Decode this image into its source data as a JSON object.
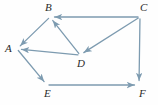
{
  "figure": {
    "kind": "directed-graph-diagram",
    "background_color": "#fefefe",
    "edge_color": "#7d9bb0",
    "label_color": "#2b2b2b"
  },
  "vertices": [
    {
      "id": "A",
      "label": "A",
      "x": 17,
      "y": 49,
      "label_x": 5,
      "label_y": 43
    },
    {
      "id": "B",
      "label": "B",
      "x": 50,
      "y": 17,
      "label_x": 45,
      "label_y": 2
    },
    {
      "id": "C",
      "label": "C",
      "x": 140,
      "y": 17,
      "label_x": 140,
      "label_y": 2
    },
    {
      "id": "D",
      "label": "D",
      "x": 80,
      "y": 55,
      "label_x": 77,
      "label_y": 58
    },
    {
      "id": "E",
      "label": "E",
      "x": 47,
      "y": 85,
      "label_x": 44,
      "label_y": 88
    },
    {
      "id": "F",
      "label": "F",
      "x": 139,
      "y": 85,
      "label_x": 139,
      "label_y": 88
    }
  ],
  "edges": [
    {
      "id": "B-A",
      "from": "B",
      "to": "A",
      "directed": true
    },
    {
      "id": "C-B",
      "from": "C",
      "to": "B",
      "directed": true
    },
    {
      "id": "D-B",
      "from": "D",
      "to": "B",
      "directed": true
    },
    {
      "id": "C-D",
      "from": "C",
      "to": "D",
      "directed": true
    },
    {
      "id": "D-A",
      "from": "D",
      "to": "A",
      "directed": true
    },
    {
      "id": "A-E",
      "from": "A",
      "to": "E",
      "directed": true
    },
    {
      "id": "C-F",
      "from": "C",
      "to": "F",
      "directed": true
    },
    {
      "id": "E-F",
      "from": "E",
      "to": "F",
      "directed": true
    }
  ]
}
